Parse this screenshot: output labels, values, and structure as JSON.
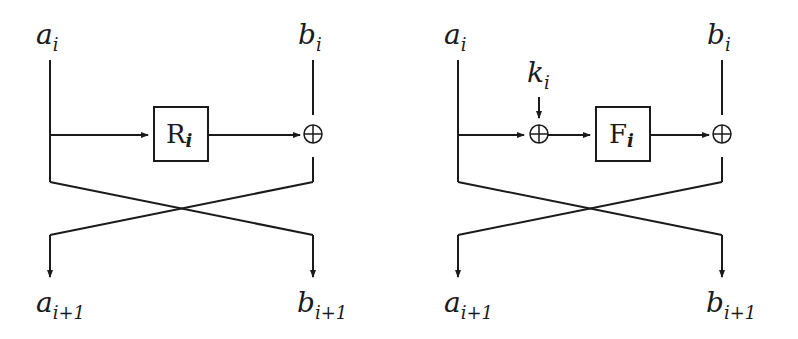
{
  "diagrams": [
    {
      "name": "left-round",
      "inputs": {
        "left": {
          "base": "a",
          "sub": "i"
        },
        "right": {
          "base": "b",
          "sub": "i"
        }
      },
      "function_box": {
        "base": "R",
        "sub": "i"
      },
      "outputs": {
        "left": {
          "base": "a",
          "sub": "i+1"
        },
        "right": {
          "base": "b",
          "sub": "i+1"
        }
      },
      "xor_symbol": "⊕"
    },
    {
      "name": "right-round",
      "inputs": {
        "left": {
          "base": "a",
          "sub": "i"
        },
        "right": {
          "base": "b",
          "sub": "i"
        }
      },
      "key": {
        "base": "k",
        "sub": "i"
      },
      "function_box": {
        "base": "F",
        "sub": "i"
      },
      "outputs": {
        "left": {
          "base": "a",
          "sub": "i+1"
        },
        "right": {
          "base": "b",
          "sub": "i+1"
        }
      },
      "xor_symbol": "⊕"
    }
  ],
  "colors": {
    "stroke": "#1a1a1a",
    "background": "#ffffff"
  }
}
